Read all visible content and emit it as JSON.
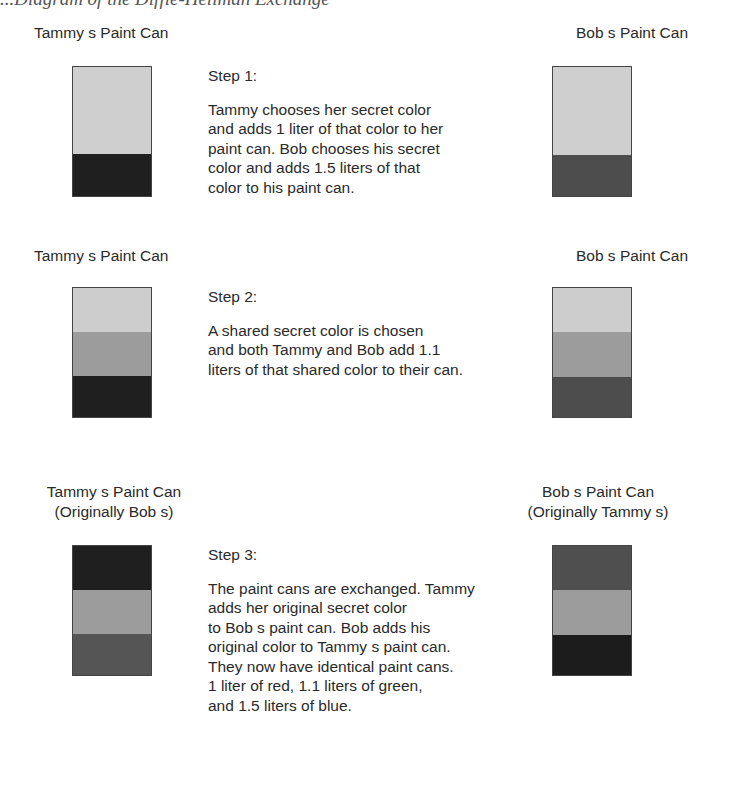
{
  "figure": {
    "title": "...Diagram of the Diffie-Hellman Exchange"
  },
  "colors": {
    "light": "#cfcfcf",
    "shared": "#9c9c9c",
    "tammy_secret": "#1f1f1f",
    "bob_secret": "#4d4d4d"
  },
  "steps": [
    {
      "left_label": "Tammy s Paint Can",
      "left_sublabel": "",
      "right_label": "Bob s Paint Can",
      "right_sublabel": "",
      "heading": "Step 1:",
      "body": "Tammy chooses her secret color\nand adds 1 liter of that color to her\npaint can. Bob chooses his secret\ncolor and adds 1.5 liters of that\ncolor to his paint can.",
      "left_can_layers": [
        "light",
        "tammy_secret"
      ],
      "right_can_layers": [
        "light",
        "bob_secret"
      ]
    },
    {
      "left_label": "Tammy s Paint Can",
      "left_sublabel": "",
      "right_label": "Bob s Paint Can",
      "right_sublabel": "",
      "heading": "Step 2:",
      "body": "A shared secret color is chosen\nand both Tammy and Bob add 1.1\nliters of that shared color to their can.",
      "left_can_layers": [
        "light",
        "shared",
        "tammy_secret"
      ],
      "right_can_layers": [
        "light",
        "shared",
        "bob_secret"
      ]
    },
    {
      "left_label": "Tammy s Paint Can",
      "left_sublabel": "(Originally Bob s)",
      "right_label": "Bob s Paint Can",
      "right_sublabel": "(Originally Tammy s)",
      "heading": "Step 3:",
      "body": "The paint cans are exchanged. Tammy\nadds her original secret color\nto Bob s paint can. Bob adds his\noriginal color to Tammy s paint can.\nThey now have identical paint cans.\n1 liter of red, 1.1 liters of green,\nand 1.5 liters of blue.",
      "left_can_layers": [
        "tammy_secret",
        "shared",
        "bob_secret"
      ],
      "right_can_layers": [
        "bob_secret",
        "shared",
        "tammy_secret"
      ]
    }
  ]
}
